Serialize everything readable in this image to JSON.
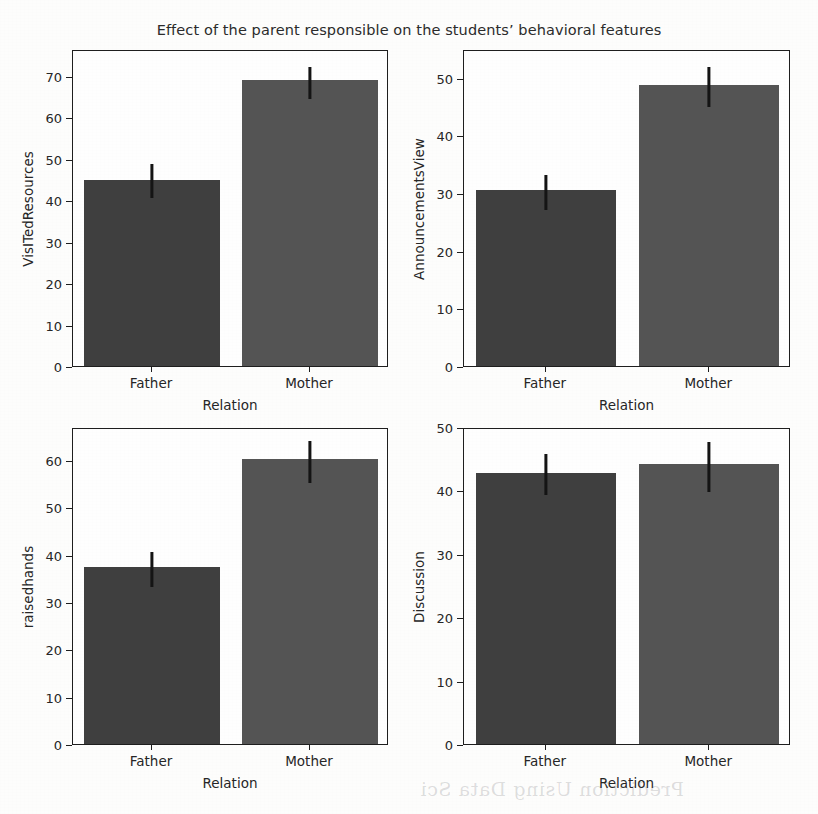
{
  "figure": {
    "title": "Effect of the parent responsible on the students’ behavioral features",
    "background_color": "#fdfdfc",
    "axis_color": "#1e1e1e",
    "artifacts": {
      "bleed_through_text": "Prediction Using Data Sci"
    }
  },
  "colors": {
    "bar_father": "#3f3f3f",
    "bar_mother": "#545454",
    "error_bar": "#141414",
    "text": "#262626"
  },
  "chart_data": [
    {
      "id": "visited-resources",
      "type": "bar",
      "title": "",
      "xlabel": "Relation",
      "ylabel": "VisITedResources",
      "categories": [
        "Father",
        "Mother"
      ],
      "values": [
        45.0,
        69.0
      ],
      "errors_low": [
        41.0,
        64.8
      ],
      "errors_high": [
        49.2,
        72.6
      ],
      "ylim": [
        0,
        76.5
      ],
      "yticks": [
        0,
        10,
        20,
        30,
        40,
        50,
        60,
        70
      ],
      "grid": false,
      "legend": "none"
    },
    {
      "id": "announcements-view",
      "type": "bar",
      "title": "",
      "xlabel": "Relation",
      "ylabel": "AnnouncementsView",
      "categories": [
        "Father",
        "Mother"
      ],
      "values": [
        30.5,
        48.7
      ],
      "errors_low": [
        27.4,
        45.2
      ],
      "errors_high": [
        33.4,
        52.3
      ],
      "ylim": [
        0,
        55.0
      ],
      "yticks": [
        0,
        10,
        20,
        30,
        40,
        50
      ],
      "grid": false,
      "legend": "none"
    },
    {
      "id": "raisedhands",
      "type": "bar",
      "title": "",
      "xlabel": "Relation",
      "ylabel": "raisedhands",
      "categories": [
        "Father",
        "Mother"
      ],
      "values": [
        37.5,
        60.2
      ],
      "errors_low": [
        33.6,
        55.6
      ],
      "errors_high": [
        41.0,
        64.4
      ],
      "ylim": [
        0,
        67.0
      ],
      "yticks": [
        0,
        10,
        20,
        30,
        40,
        50,
        60
      ],
      "grid": false,
      "legend": "none"
    },
    {
      "id": "discussion",
      "type": "bar",
      "title": "",
      "xlabel": "Relation",
      "ylabel": "Discussion",
      "categories": [
        "Father",
        "Mother"
      ],
      "values": [
        42.8,
        44.1
      ],
      "errors_low": [
        39.6,
        40.1
      ],
      "errors_high": [
        46.1,
        48.0
      ],
      "ylim": [
        0,
        50.0
      ],
      "yticks": [
        0,
        10,
        20,
        30,
        40,
        50
      ],
      "grid": false,
      "legend": "none"
    }
  ],
  "layout": {
    "panels": [
      {
        "chart": 0,
        "left": 72,
        "top": 50,
        "width": 316,
        "height": 317
      },
      {
        "chart": 1,
        "left": 463,
        "top": 50,
        "width": 327,
        "height": 317
      },
      {
        "chart": 2,
        "left": 72,
        "top": 428,
        "width": 316,
        "height": 317
      },
      {
        "chart": 3,
        "left": 463,
        "top": 428,
        "width": 327,
        "height": 317
      }
    ]
  }
}
